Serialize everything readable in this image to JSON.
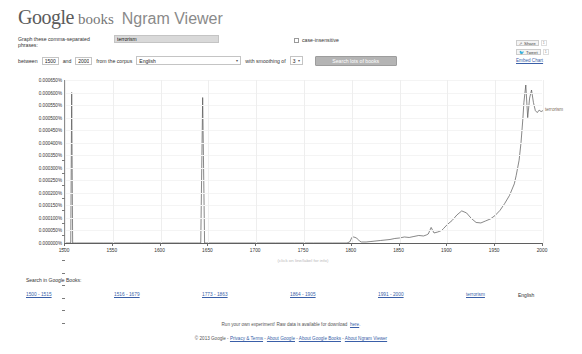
{
  "header": {
    "logo_google": "Google",
    "logo_books": "books",
    "title": "Ngram Viewer"
  },
  "query_form": {
    "phrases_label": "Graph these comma-separated phrases:",
    "phrase_value": "terrorism",
    "phrase_placeholder": "",
    "case_insensitive_label": "case-insensitive",
    "case_insensitive_checked": false,
    "between_label": "between",
    "year_start": "1500",
    "and_label": "and",
    "year_end": "2000",
    "corpus_label": "from the corpus",
    "corpus_value": "English",
    "smoothing_label": "with smoothing of",
    "smoothing_value": "3",
    "search_button": "Search lots of books"
  },
  "share_panel": {
    "share_label": "Share",
    "share_count": "1",
    "tweet_label": "Tweet",
    "tweet_count": "1",
    "embed_label": "Embed Chart"
  },
  "chart_data": {
    "type": "line",
    "title": "",
    "xlabel": "",
    "ylabel": "",
    "series_label": "terrorism",
    "xlim": [
      1500,
      2000
    ],
    "ylim": [
      0.0,
      0.00065
    ],
    "grid": true,
    "legend_position": "right-inline",
    "axis_note": "(click on line/label for info)",
    "x_ticks": [
      "1500",
      "1550",
      "1600",
      "1650",
      "1700",
      "1750",
      "1800",
      "1850",
      "1900",
      "1950",
      "2000"
    ],
    "y_ticks": [
      "0.000650%",
      "0.000600%",
      "0.000550%",
      "0.000500%",
      "0.000450%",
      "0.000400%",
      "0.000350%",
      "0.000300%",
      "0.000250%",
      "0.000200%",
      "0.000150%",
      "0.000100%",
      "0.000050%",
      "0.000000%"
    ],
    "x": [
      1500,
      1504,
      1506,
      1507,
      1508,
      1510,
      1512,
      1540,
      1580,
      1620,
      1640,
      1642,
      1644,
      1646,
      1648,
      1650,
      1680,
      1700,
      1720,
      1740,
      1760,
      1780,
      1795,
      1798,
      1800,
      1802,
      1805,
      1808,
      1810,
      1815,
      1820,
      1830,
      1840,
      1845,
      1850,
      1855,
      1860,
      1865,
      1870,
      1875,
      1878,
      1880,
      1883,
      1886,
      1890,
      1894,
      1896,
      1900,
      1905,
      1910,
      1915,
      1920,
      1925,
      1930,
      1935,
      1940,
      1945,
      1950,
      1955,
      1960,
      1965,
      1970,
      1972,
      1975,
      1977,
      1979,
      1980,
      1982,
      1984,
      1986,
      1988,
      1990,
      1992,
      1994,
      1996,
      1998,
      2000
    ],
    "values": [
      0.0,
      0.0,
      0.0,
      0.0006,
      0.0,
      0.0,
      0.0,
      0.0,
      0.0,
      0.0,
      0.0,
      0.0,
      0.00058,
      0.0,
      0.0,
      0.0,
      0.0,
      0.0,
      0.0,
      0.0,
      0.0,
      0.0,
      0.0,
      5e-06,
      2.2e-05,
      2.4e-05,
      2e-05,
      8e-06,
      4e-06,
      4e-06,
      6e-06,
      1e-05,
      1.4e-05,
      1.8e-05,
      2e-05,
      2.4e-05,
      2.2e-05,
      2.6e-05,
      3e-05,
      2.8e-05,
      3.2e-05,
      3.6e-05,
      6.2e-05,
      4e-05,
      4.4e-05,
      5e-05,
      5.8e-05,
      7.4e-05,
      9e-05,
      0.000112,
      0.000128,
      0.00012,
      9.8e-05,
      8.2e-05,
      8e-05,
      8.8e-05,
      9.6e-05,
      0.00011,
      0.00013,
      0.000158,
      0.00019,
      0.000236,
      0.00027,
      0.00033,
      0.0004,
      0.000498,
      0.00056,
      0.00063,
      0.0005,
      0.000578,
      0.00061,
      0.00056,
      0.000528,
      0.00052,
      0.00053,
      0.000524,
      0.000528
    ]
  },
  "search_in_books": {
    "heading": "Search in Google Books:",
    "links": [
      "1500 - 1515",
      "1516 - 1679",
      "1773 - 1863",
      "1864 - 1905",
      "1991 - 2000"
    ],
    "term": "terrorism",
    "language": "English"
  },
  "footer": {
    "experiment_text": "Run your own experiment! Raw data is available for download",
    "experiment_link": "here",
    "experiment_end": ".",
    "copyright": "© 2013 Google",
    "links": [
      "Privacy & Terms",
      "About Google",
      "About Google Books",
      "About Ngram Viewer"
    ],
    "separator": " - "
  }
}
